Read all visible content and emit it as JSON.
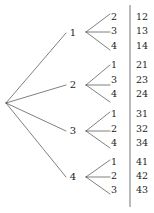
{
  "figure": {
    "kind": "probability-tree-diagram",
    "width": 154,
    "height": 213,
    "background_color": "#ffffff",
    "line_color": "#3a3a3a",
    "text_color": "#1b1b1b"
  },
  "chart_data": {
    "type": "diagram",
    "title": "",
    "root": {
      "label": "",
      "x": 6,
      "y": 103
    },
    "branches": [
      {
        "label": "1",
        "x": 73,
        "y": 33,
        "fan_x": 86,
        "fan_y": 32,
        "leaves": [
          {
            "label": "2",
            "outcome": "12",
            "x": 114,
            "y": 17,
            "outcome_x": 136,
            "tip_x": 110,
            "tip_y": 14
          },
          {
            "label": "3",
            "outcome": "13",
            "x": 114,
            "y": 31,
            "outcome_x": 136,
            "tip_x": 110,
            "tip_y": 32
          },
          {
            "label": "4",
            "outcome": "14",
            "x": 114,
            "y": 46,
            "outcome_x": 136,
            "tip_x": 110,
            "tip_y": 50
          }
        ]
      },
      {
        "label": "2",
        "x": 73,
        "y": 85,
        "fan_x": 86,
        "fan_y": 85,
        "leaves": [
          {
            "label": "1",
            "outcome": "21",
            "x": 114,
            "y": 65,
            "outcome_x": 136,
            "tip_x": 110,
            "tip_y": 65
          },
          {
            "label": "3",
            "outcome": "23",
            "x": 114,
            "y": 80,
            "outcome_x": 136,
            "tip_x": 110,
            "tip_y": 85
          },
          {
            "label": "4",
            "outcome": "24",
            "x": 114,
            "y": 94,
            "outcome_x": 136,
            "tip_x": 110,
            "tip_y": 102
          }
        ]
      },
      {
        "label": "3",
        "x": 73,
        "y": 131,
        "fan_x": 86,
        "fan_y": 131,
        "leaves": [
          {
            "label": "1",
            "outcome": "31",
            "x": 114,
            "y": 114,
            "outcome_x": 136,
            "tip_x": 110,
            "tip_y": 112
          },
          {
            "label": "2",
            "outcome": "32",
            "x": 114,
            "y": 129,
            "outcome_x": 136,
            "tip_x": 110,
            "tip_y": 131
          },
          {
            "label": "4",
            "outcome": "34",
            "x": 114,
            "y": 143,
            "outcome_x": 136,
            "tip_x": 110,
            "tip_y": 148
          }
        ]
      },
      {
        "label": "4",
        "x": 73,
        "y": 177,
        "fan_x": 86,
        "fan_y": 177,
        "leaves": [
          {
            "label": "1",
            "outcome": "41",
            "x": 114,
            "y": 162,
            "outcome_x": 136,
            "tip_x": 110,
            "tip_y": 160
          },
          {
            "label": "2",
            "outcome": "42",
            "x": 114,
            "y": 176,
            "outcome_x": 136,
            "tip_x": 110,
            "tip_y": 177
          },
          {
            "label": "3",
            "outcome": "43",
            "x": 114,
            "y": 190,
            "outcome_x": 136,
            "tip_x": 110,
            "tip_y": 194
          }
        ]
      }
    ],
    "divider": {
      "x": 130,
      "y_top": 5,
      "y_bottom": 207
    },
    "outcomes": [
      "12",
      "13",
      "14",
      "21",
      "23",
      "24",
      "31",
      "32",
      "34",
      "41",
      "42",
      "43"
    ],
    "first_draw_values": [
      "1",
      "2",
      "3",
      "4"
    ],
    "second_draw_values": [
      "1",
      "2",
      "3",
      "4"
    ]
  }
}
